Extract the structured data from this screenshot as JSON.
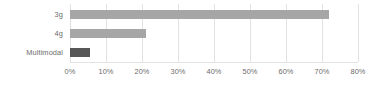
{
  "chart_data": {
    "type": "bar",
    "orientation": "horizontal",
    "title": "",
    "subtitle": "",
    "xlabel": "",
    "ylabel": "",
    "categories": [
      "3g",
      "4g",
      "Multimodal"
    ],
    "values": [
      72,
      21,
      5.5
    ],
    "value_format": "percent",
    "xlim": [
      0,
      80
    ],
    "xticks": [
      0,
      10,
      20,
      30,
      40,
      50,
      60,
      70,
      80
    ],
    "xtick_labels": [
      "0%",
      "10%",
      "20%",
      "30%",
      "40%",
      "50%",
      "60%",
      "70%",
      "80%"
    ],
    "grid": true,
    "grid_axis": "x",
    "legend": false,
    "legend_position": "none",
    "series": [
      {
        "name": "",
        "values": [
          72,
          21,
          5.5
        ],
        "bar_colors": [
          "#a6a6a6",
          "#a6a6a6",
          "#575757"
        ]
      }
    ],
    "colors": {
      "bar_light": "#a6a6a6",
      "bar_dark": "#575757",
      "gridline": "#e2e2e2",
      "text": "#6b6b6b",
      "background": "#ffffff"
    },
    "bars": [
      {
        "label": "3g",
        "value": 72,
        "color": "#a6a6a6"
      },
      {
        "label": "4g",
        "value": 21,
        "color": "#a6a6a6"
      },
      {
        "label": "Multimodal",
        "value": 5.5,
        "color": "#575757"
      }
    ]
  }
}
